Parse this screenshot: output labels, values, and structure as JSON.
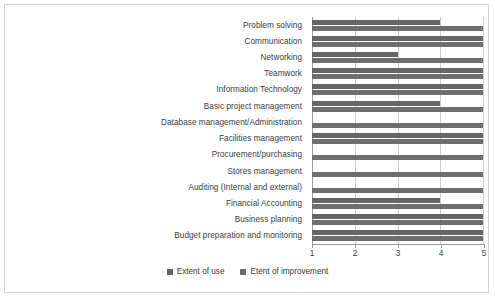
{
  "chart_data": {
    "type": "bar",
    "orientation": "horizontal",
    "title": "",
    "xlabel": "",
    "ylabel": "",
    "xlim": [
      1,
      5
    ],
    "xticks": [
      1,
      2,
      3,
      4,
      5
    ],
    "xtick_labels": [
      "1",
      "2",
      "3",
      "4",
      "5"
    ],
    "grid": true,
    "grid_axis": "x",
    "legend_position": "bottom",
    "categories": [
      "Problem solving",
      "Communication",
      "Networking",
      "Teamwork",
      "Information Technology",
      "Basic project management",
      "Database management/Administration",
      "Facilities management",
      "Procurement/purchasing",
      "Stores management",
      "Auditing (Internal and external)",
      "Financial Accounting",
      "Business planning",
      "Budget preparation and monitoring"
    ],
    "series": [
      {
        "name": "Extent of use",
        "color": "#666666",
        "values": [
          4,
          5,
          3,
          5,
          5,
          4,
          1,
          5,
          1,
          1,
          1,
          4,
          5,
          5
        ]
      },
      {
        "name": "Etent of improvement",
        "color": "#6e6e6e",
        "values": [
          5,
          5,
          5,
          5,
          5,
          5,
          5,
          5,
          5,
          5,
          5,
          5,
          5,
          5
        ]
      }
    ]
  },
  "legend": {
    "items": [
      {
        "label": "Extent of use"
      },
      {
        "label": "Etent of improvement"
      }
    ]
  }
}
